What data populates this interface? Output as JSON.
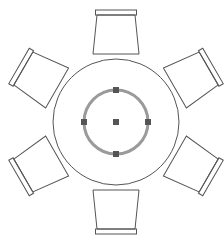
{
  "drawing": {
    "object": "round-table-with-chairs",
    "chair_count": 6,
    "chair_angles_deg": [
      0,
      60,
      120,
      180,
      240,
      300
    ],
    "colors": {
      "outline": "#555555",
      "selection_circle": "#9a9a9a",
      "grip": "#555555",
      "background": "#ffffff"
    },
    "selection": {
      "selected_element": "inner-circle",
      "grips": [
        "top",
        "right",
        "bottom",
        "left",
        "center"
      ]
    }
  },
  "caption": {
    "text": ""
  }
}
